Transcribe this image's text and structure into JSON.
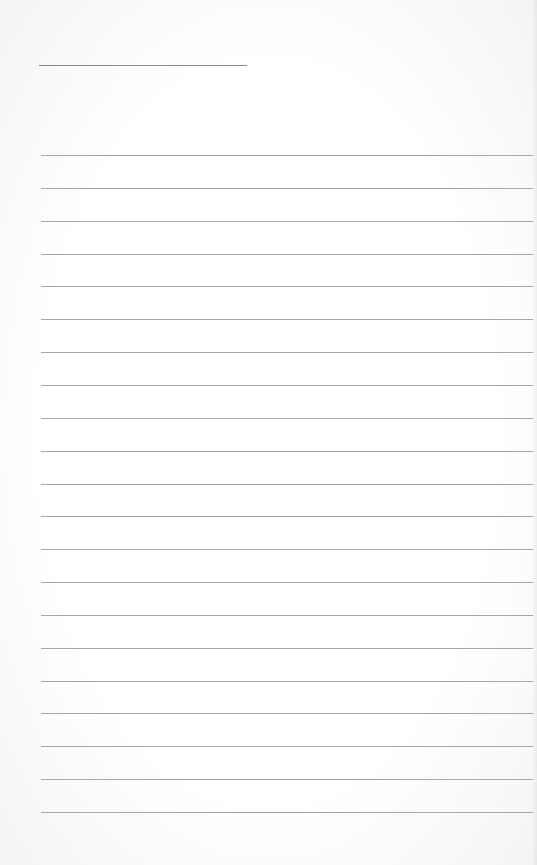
{
  "document": {
    "type": "lined-paper",
    "title_line": {
      "present": true
    },
    "rule_count": 21,
    "colors": {
      "paper": "#ffffff",
      "rule": "#a8a8a8",
      "title_rule": "#8a8a8a"
    }
  }
}
